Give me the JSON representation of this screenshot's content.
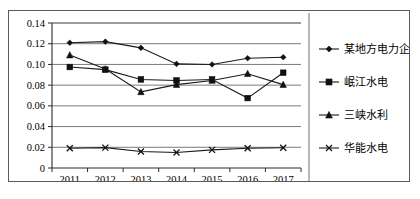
{
  "chart_data": {
    "type": "line",
    "title": "",
    "xlabel": "",
    "ylabel": "",
    "categories": [
      "2011",
      "2012",
      "2013",
      "2014",
      "2015",
      "2016",
      "2017"
    ],
    "ylim": [
      0,
      0.14
    ],
    "ytick_labels": [
      "0",
      "0.02",
      "0.04",
      "0.06",
      "0.08",
      "0.10",
      "0.12",
      "0.14"
    ],
    "ytick_values": [
      0,
      0.02,
      0.04,
      0.06,
      0.08,
      0.1,
      0.12,
      0.14
    ],
    "grid": "horizontal",
    "legend_position": "right",
    "series": [
      {
        "name": "某地方电力企业A",
        "marker": "diamond",
        "values": [
          0.121,
          0.122,
          0.116,
          0.1005,
          0.1,
          0.106,
          0.107
        ]
      },
      {
        "name": "岷江水电",
        "marker": "square",
        "values": [
          0.0975,
          0.095,
          0.0855,
          0.0845,
          0.0855,
          0.0675,
          0.092
        ]
      },
      {
        "name": "三峡水利",
        "marker": "triangle",
        "values": [
          0.109,
          0.0955,
          0.0735,
          0.0805,
          0.0845,
          0.091,
          0.0805
        ]
      },
      {
        "name": "华能水电",
        "marker": "x",
        "values": [
          0.019,
          0.0197,
          0.016,
          0.015,
          0.0175,
          0.019,
          0.0195
        ]
      }
    ]
  },
  "legend": {
    "items": [
      {
        "label": "某地方电力企业A",
        "marker": "diamond"
      },
      {
        "label": "岷江水电",
        "marker": "square"
      },
      {
        "label": "三峡水利",
        "marker": "triangle"
      },
      {
        "label": "华能水电",
        "marker": "x"
      }
    ]
  }
}
